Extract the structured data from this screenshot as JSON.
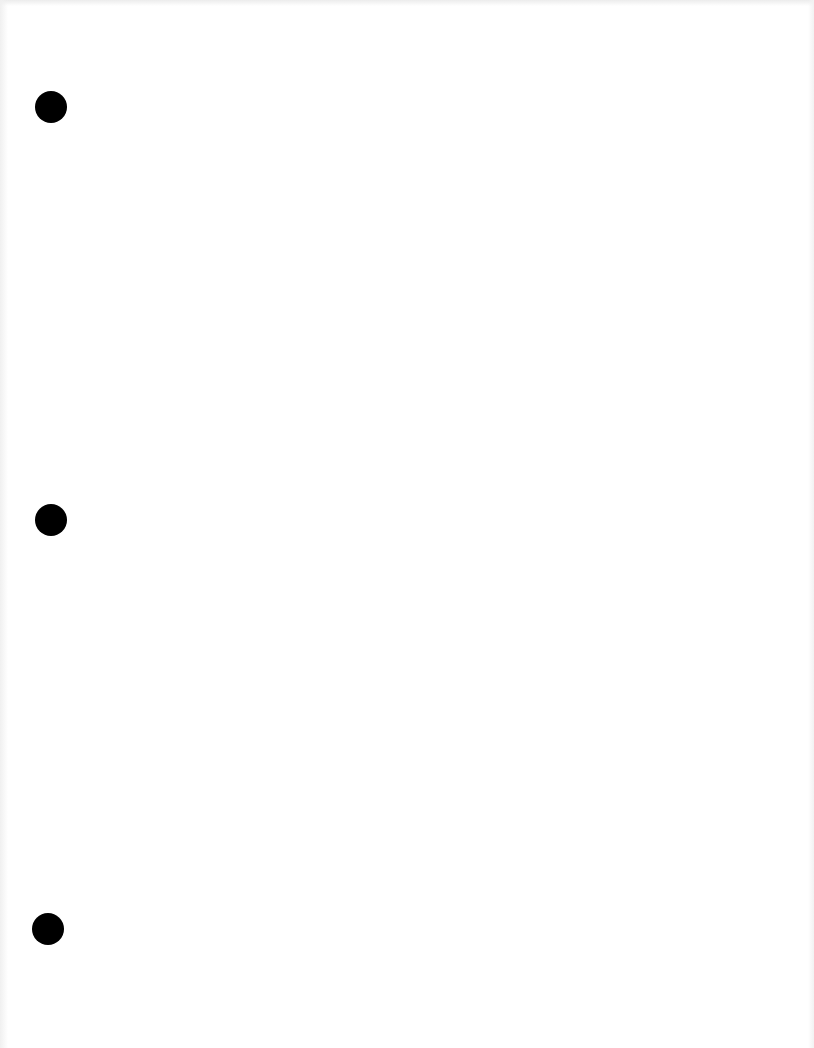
{
  "page": {
    "type": "blank-sheet",
    "background_color": "#ffffff",
    "text_content": "",
    "punch_holes": [
      {
        "id": "top",
        "cx": 51,
        "cy": 107,
        "diameter": 32,
        "color": "#000000"
      },
      {
        "id": "middle",
        "cx": 51,
        "cy": 520,
        "diameter": 32,
        "color": "#000000"
      },
      {
        "id": "bottom",
        "cx": 48,
        "cy": 929,
        "diameter": 32,
        "color": "#000000"
      }
    ]
  }
}
